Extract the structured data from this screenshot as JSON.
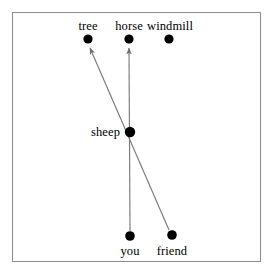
{
  "diagram": {
    "background_color": "#ffffff",
    "frame_color": "#8c8c8c",
    "node_color": "#000000",
    "edge_color": "#7a7a7a",
    "frame": {
      "x": 12,
      "y": 12,
      "width": 249,
      "height": 250
    },
    "nodes": [
      {
        "id": "tree",
        "label": "tree",
        "x": 88,
        "y": 39,
        "r": 4.6,
        "label_pos": "above",
        "label_x": 88,
        "label_y": 20
      },
      {
        "id": "horse",
        "label": "horse",
        "x": 129,
        "y": 39,
        "r": 4.6,
        "label_pos": "above",
        "label_x": 129,
        "label_y": 20
      },
      {
        "id": "windmill",
        "label": "windmill",
        "x": 169,
        "y": 39,
        "r": 4.6,
        "label_pos": "above",
        "label_x": 170,
        "label_y": 20
      },
      {
        "id": "sheep",
        "label": "sheep",
        "x": 130,
        "y": 132,
        "r": 5.2,
        "label_pos": "left",
        "label_x": 120,
        "label_y": 132
      },
      {
        "id": "you",
        "label": "you",
        "x": 130,
        "y": 236,
        "r": 4.8,
        "label_pos": "below",
        "label_x": 130,
        "label_y": 245
      },
      {
        "id": "friend",
        "label": "friend",
        "x": 172,
        "y": 235,
        "r": 4.8,
        "label_pos": "below",
        "label_x": 172,
        "label_y": 245
      }
    ],
    "edges": [
      {
        "id": "you-to-horse",
        "from": "you",
        "to": "horse",
        "x1": 130,
        "y1": 231,
        "x2": 129,
        "y2": 48,
        "arrow": "end"
      },
      {
        "id": "friend-to-tree",
        "from": "friend",
        "to": "tree",
        "x1": 169,
        "y1": 230,
        "x2": 90,
        "y2": 48,
        "arrow": "end"
      }
    ]
  }
}
